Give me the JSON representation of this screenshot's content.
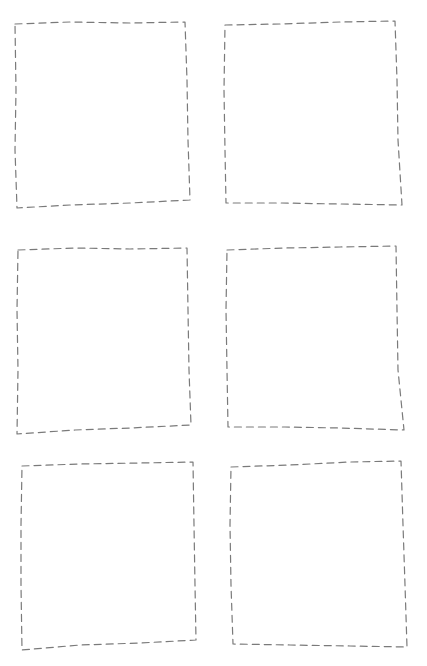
{
  "diagram": {
    "type": "wireframe-placeholder-grid",
    "layout": {
      "rows": 3,
      "columns": 2
    },
    "stroke_color": "#7a7a7a",
    "background_color": "#ffffff",
    "boxes": [
      {
        "id": "box-1",
        "row": 1,
        "col": 1,
        "label": "",
        "points": "15,24 70,22 130,23 185,22 187,80 188,140 190,200 130,203 70,205 17,208 15,150 16,90"
      },
      {
        "id": "box-2",
        "row": 1,
        "col": 2,
        "label": "",
        "points": "225,25 280,24 340,22 395,21 397,80 398,140 402,205 340,204 280,203 226,203 225,150 224,90"
      },
      {
        "id": "box-3",
        "row": 2,
        "col": 1,
        "label": "",
        "points": "18,250 75,248 130,249 187,248 188,310 189,370 191,425 130,428 75,430 17,434 18,370 17,310"
      },
      {
        "id": "box-4",
        "row": 2,
        "col": 2,
        "label": "",
        "points": "227,250 285,248 340,247 396,246 397,310 398,370 404,430 340,428 285,427 228,427 227,370 226,310"
      },
      {
        "id": "box-5",
        "row": 3,
        "col": 1,
        "label": "",
        "points": "22,466 80,464 140,463 193,462 194,525 195,585 196,640 140,643 80,645 22,650 21,585 21,525"
      },
      {
        "id": "box-6",
        "row": 3,
        "col": 2,
        "label": "",
        "points": "231,467 290,465 350,462 401,461 403,525 405,585 407,647 350,646 290,645 233,644 231,585 230,525"
      }
    ]
  }
}
